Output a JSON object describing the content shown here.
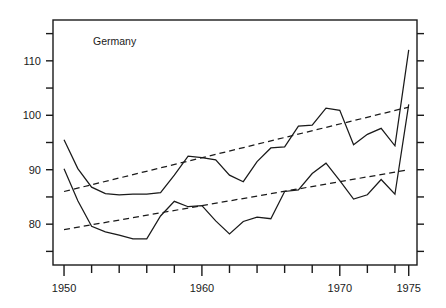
{
  "chart_data": {
    "type": "line",
    "title": "",
    "annotation": "Germany",
    "xlabel": "",
    "ylabel": "",
    "xlim": [
      1949.2,
      1975.6
    ],
    "ylim": [
      72.5,
      117.5
    ],
    "grid": false,
    "legend": "none",
    "x_tick_labels": [
      "1950",
      "1960",
      "1970",
      "1975"
    ],
    "x_labeled_ticks": [
      1950,
      1960,
      1970,
      1975
    ],
    "x_minor_ticks": [
      1952,
      1954,
      1956,
      1958,
      1962,
      1964,
      1966,
      1968,
      1972,
      1974
    ],
    "y_tick_labels": [
      "110",
      "100",
      "90",
      "80"
    ],
    "y_labeled_ticks": [
      110,
      100,
      90,
      80
    ],
    "y_minor_ticks": [
      115,
      105,
      95,
      85,
      75
    ],
    "series": [
      {
        "name": "upper-series",
        "style": "solid",
        "x": [
          1950,
          1951,
          1952,
          1953,
          1954,
          1955,
          1956,
          1957,
          1958,
          1959,
          1960,
          1961,
          1962,
          1963,
          1964,
          1965,
          1966,
          1967,
          1968,
          1969,
          1970,
          1971,
          1972,
          1973,
          1974,
          1975
        ],
        "values": [
          95.5,
          90.2,
          86.8,
          85.6,
          85.4,
          85.5,
          85.5,
          85.8,
          89.0,
          92.5,
          92.2,
          91.8,
          89.0,
          87.8,
          91.5,
          94.0,
          94.2,
          98.0,
          98.2,
          101.3,
          100.9,
          94.6,
          96.5,
          97.6,
          94.4,
          112.0
        ]
      },
      {
        "name": "lower-series",
        "style": "solid",
        "x": [
          1950,
          1951,
          1952,
          1953,
          1954,
          1955,
          1956,
          1957,
          1958,
          1959,
          1960,
          1961,
          1962,
          1963,
          1964,
          1965,
          1966,
          1967,
          1968,
          1969,
          1970,
          1971,
          1972,
          1973,
          1974,
          1975
        ],
        "values": [
          90.2,
          84.3,
          79.6,
          78.6,
          78.0,
          77.3,
          77.3,
          81.5,
          84.2,
          83.2,
          83.4,
          80.6,
          78.2,
          80.5,
          81.3,
          81.0,
          86.0,
          86.3,
          89.3,
          91.2,
          88.0,
          84.6,
          85.4,
          88.2,
          85.5,
          102.0
        ]
      },
      {
        "name": "upper-trend-line",
        "style": "dashed",
        "x": [
          1950,
          1975
        ],
        "values": [
          86.0,
          101.5
        ]
      },
      {
        "name": "lower-trend-line",
        "style": "dashed",
        "x": [
          1950,
          1975
        ],
        "values": [
          79.0,
          90.0
        ]
      }
    ]
  },
  "axes": {
    "frame_color": "#1a1a1a"
  }
}
